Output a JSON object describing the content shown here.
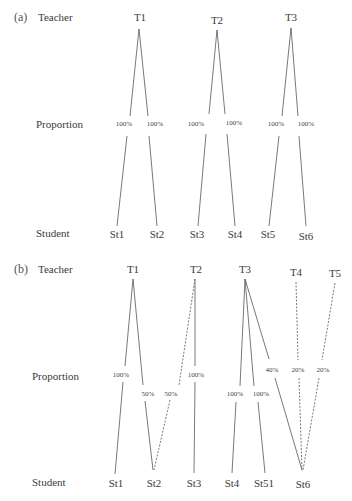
{
  "panels": [
    {
      "tag": "(a)",
      "row_labels": {
        "teacher": "Teacher",
        "proportion": "Proportion",
        "student": "Student"
      },
      "teachers": [
        "T1",
        "T2",
        "T3"
      ],
      "students": [
        "St1",
        "St2",
        "St3",
        "St4",
        "St5",
        "St6"
      ],
      "edges": [
        {
          "from": "T1",
          "to": "St1",
          "proportion": "100%",
          "style": "solid"
        },
        {
          "from": "T1",
          "to": "St2",
          "proportion": "100%",
          "style": "solid"
        },
        {
          "from": "T2",
          "to": "St3",
          "proportion": "100%",
          "style": "solid"
        },
        {
          "from": "T2",
          "to": "St4",
          "proportion": "100%",
          "style": "solid"
        },
        {
          "from": "T3",
          "to": "St5",
          "proportion": "100%",
          "style": "solid"
        },
        {
          "from": "T3",
          "to": "St6",
          "proportion": "100%",
          "style": "solid"
        }
      ]
    },
    {
      "tag": "(b)",
      "row_labels": {
        "teacher": "Teacher",
        "proportion": "Proportion",
        "student": "Student"
      },
      "teachers": [
        "T1",
        "T2",
        "T3",
        "T4",
        "T5"
      ],
      "students": [
        "St1",
        "St2",
        "St3",
        "St4",
        "St51",
        "St6"
      ],
      "edges": [
        {
          "from": "T1",
          "to": "St1",
          "proportion": "100%",
          "style": "solid"
        },
        {
          "from": "T1",
          "to": "St2",
          "proportion": "50%",
          "style": "solid"
        },
        {
          "from": "T2",
          "to": "St2",
          "proportion": "50%",
          "style": "dashed"
        },
        {
          "from": "T2",
          "to": "St3",
          "proportion": "100%",
          "style": "solid"
        },
        {
          "from": "T3",
          "to": "St4",
          "proportion": "100%",
          "style": "solid"
        },
        {
          "from": "T3",
          "to": "St51",
          "proportion": "100%",
          "style": "solid"
        },
        {
          "from": "T3",
          "to": "St6",
          "proportion": "40%",
          "style": "solid"
        },
        {
          "from": "T4",
          "to": "St6",
          "proportion": "20%",
          "style": "dashed"
        },
        {
          "from": "T5",
          "to": "St6",
          "proportion": "20%",
          "style": "dashed"
        }
      ]
    }
  ]
}
